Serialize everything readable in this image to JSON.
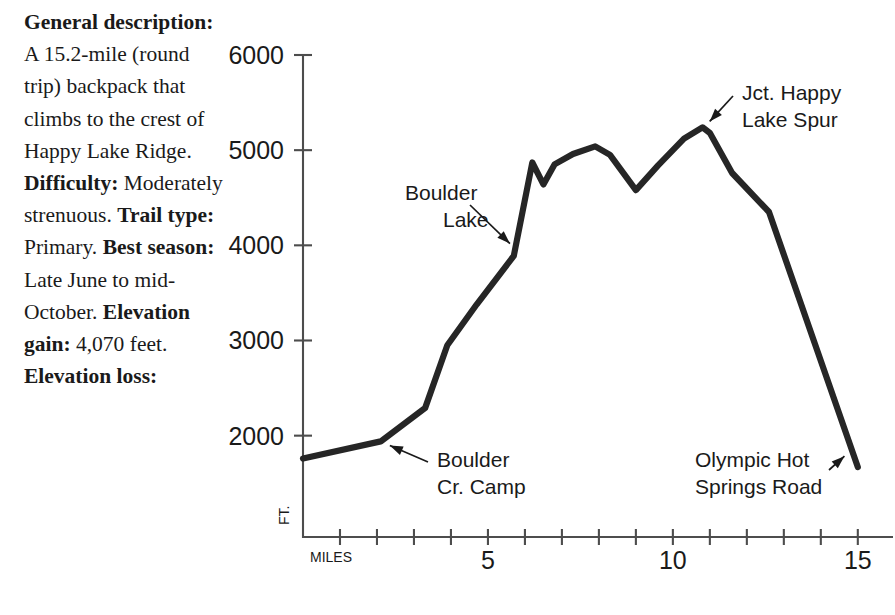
{
  "sidebar": {
    "entries": [
      {
        "label": "General description:",
        "text": "A 15.2-mile (round trip) backpack that climbs to the crest of Happy Lake Ridge."
      },
      {
        "label": "Difficulty:",
        "text": "Moderately strenuous."
      },
      {
        "label": "Trail type:",
        "text": "Primary."
      },
      {
        "label": "Best season:",
        "text": "Late June to mid-October."
      },
      {
        "label": "Elevation gain:",
        "text": "4,070 feet."
      },
      {
        "label": "Elevation loss:",
        "text": ""
      }
    ]
  },
  "chart_data": {
    "type": "line",
    "title": "",
    "xlabel": "MILES",
    "ylabel": "FT.",
    "xlim": [
      0,
      15.6
    ],
    "ylim": [
      935,
      6000
    ],
    "grid": false,
    "legend": "none",
    "x_ticks_major": [
      5,
      10,
      15
    ],
    "x_ticks_minor": [
      1,
      2,
      3,
      4,
      6,
      7,
      8,
      9,
      11,
      12,
      13,
      14
    ],
    "x_tick_labels": [
      "5",
      "10",
      "15"
    ],
    "y_ticks": [
      2000,
      3000,
      4000,
      5000,
      6000
    ],
    "y_tick_labels": [
      "2000",
      "3000",
      "4000",
      "5000",
      "6000"
    ],
    "series": [
      {
        "name": "Happy Lake Ridge elevation profile",
        "color": "#262626",
        "x": [
          0.0,
          2.1,
          3.3,
          3.9,
          4.7,
          5.7,
          6.2,
          6.5,
          6.8,
          7.3,
          7.9,
          8.3,
          9.0,
          9.6,
          10.3,
          10.8,
          11.0,
          11.6,
          12.6,
          15.0
        ],
        "y": [
          1760,
          1940,
          2290,
          2950,
          3380,
          3890,
          4870,
          4640,
          4850,
          4960,
          5040,
          4950,
          4580,
          4840,
          5120,
          5240,
          5180,
          4760,
          4350,
          1670
        ]
      }
    ],
    "annotations": [
      {
        "name": "boulder-lake",
        "text_line1": "Boulder",
        "text_line2": "Lake",
        "point_x": 5.75,
        "point_y": 3960
      },
      {
        "name": "boulder-cr-camp",
        "text_line1": "Boulder",
        "text_line2": "Cr. Camp",
        "point_x": 2.15,
        "point_y": 1930
      },
      {
        "name": "jct-happy-lake-spur",
        "text_line1": "Jct. Happy",
        "text_line2": "Lake Spur",
        "point_x": 10.85,
        "point_y": 5240
      },
      {
        "name": "olympic-hot-springs-road",
        "text_line1": "Olympic Hot",
        "text_line2": "Springs Road",
        "point_x": 14.8,
        "point_y": 1840
      }
    ]
  }
}
